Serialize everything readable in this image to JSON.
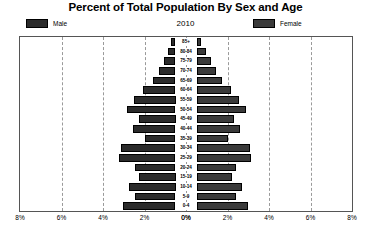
{
  "chart_data": {
    "type": "bar",
    "subtype": "population-pyramid",
    "title": "Percent of Total Population By Sex and Age",
    "year_label": "2010",
    "xlabel": "",
    "ylabel": "",
    "grid": true,
    "legend_position": "top",
    "axis_max_percent": 8,
    "xtick_labels_left": [
      "8%",
      "6%",
      "4%",
      "2%",
      "0%"
    ],
    "xtick_labels_right": [
      "0%",
      "2%",
      "4%",
      "6%",
      "8%"
    ],
    "xtick_values_left": [
      8,
      6,
      4,
      2,
      0
    ],
    "xtick_values_right": [
      0,
      2,
      4,
      6,
      8
    ],
    "categories": [
      "85+",
      "80-84",
      "75-79",
      "70-74",
      "65-69",
      "60-64",
      "55-59",
      "50-54",
      "45-49",
      "40-44",
      "35-39",
      "30-34",
      "25-29",
      "20-24",
      "15-19",
      "10-14",
      "5-9",
      "0-4"
    ],
    "series": [
      {
        "name": "Male",
        "color": "#2b2b2b",
        "values": [
          0.2,
          0.38,
          0.55,
          0.78,
          1.1,
          1.55,
          2.0,
          2.35,
          1.75,
          2.05,
          1.45,
          2.65,
          2.7,
          1.95,
          1.75,
          2.25,
          1.95,
          2.55
        ]
      },
      {
        "name": "Female",
        "color": "#3a3a3a",
        "values": [
          0.24,
          0.48,
          0.72,
          0.95,
          1.25,
          1.65,
          2.05,
          2.4,
          1.8,
          2.1,
          1.5,
          2.6,
          2.65,
          1.9,
          1.7,
          2.2,
          1.9,
          2.5
        ]
      }
    ]
  },
  "legend": {
    "male_label": "Male",
    "female_label": "Female",
    "male_color": "#2b2b2b",
    "female_color": "#3a3a3a"
  }
}
